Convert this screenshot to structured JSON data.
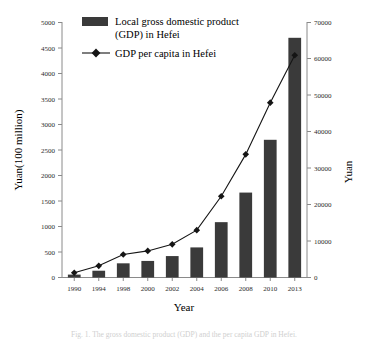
{
  "figure": {
    "caption": "Fig. 1. The gross domestic product (GDP) and the per capita GDP in Hefei."
  },
  "legend": {
    "items": [
      {
        "label_line1": "Local gross domestic product",
        "label_line2": "(GDP) in Hefei",
        "marker": "bar-swatch",
        "color": "#3a3a3a"
      },
      {
        "label_line1": "GDP per capita in Hefei",
        "label_line2": "",
        "marker": "line-diamond-marker",
        "color": "#151515"
      }
    ]
  },
  "chart_data": {
    "type": "bar",
    "title": "",
    "xlabel": "Year",
    "ylabel": "Yuan(100 million)",
    "y2label": "Yuan",
    "categories": [
      "1990",
      "1994",
      "1998",
      "2000",
      "2002",
      "2004",
      "2006",
      "2008",
      "2010",
      "2013"
    ],
    "ylim": [
      0,
      5000
    ],
    "y2lim": [
      0,
      70000
    ],
    "yticks": [
      0,
      500,
      1000,
      1500,
      2000,
      2500,
      3000,
      3500,
      4000,
      4500,
      5000
    ],
    "y2ticks": [
      0,
      10000,
      20000,
      30000,
      40000,
      50000,
      60000,
      70000
    ],
    "grid": false,
    "legend_position": "top-left",
    "series": [
      {
        "name": "Local gross domestic product (GDP) in Hefei",
        "kind": "bar",
        "axis": "left",
        "unit": "Yuan(100 million)",
        "values": [
          57,
          133,
          278,
          325,
          420,
          590,
          1085,
          1665,
          2700,
          4700
        ]
      },
      {
        "name": "GDP per capita in Hefei",
        "kind": "line",
        "axis": "right",
        "unit": "Yuan",
        "values": [
          1300,
          3200,
          6300,
          7300,
          9100,
          13000,
          22300,
          33800,
          48000,
          61000
        ]
      }
    ]
  }
}
